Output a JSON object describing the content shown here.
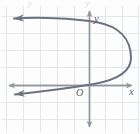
{
  "figure": {
    "name": "parabola-graph",
    "width": 140,
    "height": 134,
    "background_color": "#fdfdfd",
    "grid": {
      "visible": true,
      "color": "#e3e6ea",
      "spacing_px": 17,
      "x_lines": [
        6,
        23,
        40,
        57,
        74,
        91,
        108,
        125
      ],
      "y_lines": [
        16,
        33,
        50,
        68,
        85,
        102,
        119
      ]
    },
    "axes": {
      "color": "#8a8f96",
      "x_axis_y": 85,
      "y_axis_x": 89,
      "x_label": "x",
      "y_label": "y",
      "origin_label": "O",
      "arrows": [
        "left",
        "right",
        "up",
        "down"
      ]
    },
    "curve": {
      "color": "#6b7280",
      "stroke_width": 2,
      "orientation": "opens-left",
      "vertex_px": [
        131,
        58
      ],
      "y_axis_crossings_px": [
        [
          89,
          29
        ],
        [
          89,
          82
        ]
      ],
      "endpoints_px": [
        [
          7,
          20
        ],
        [
          8,
          95
        ]
      ],
      "arrowheads": 2
    },
    "top_ghost_text": "y y"
  }
}
